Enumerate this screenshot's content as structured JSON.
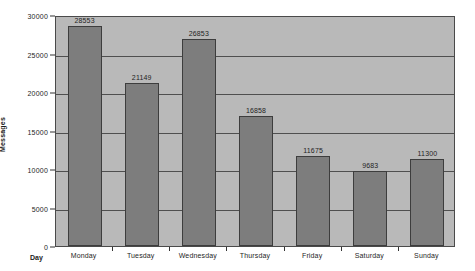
{
  "chart_data": {
    "type": "bar",
    "title": "",
    "subtitle": "",
    "xlabel": "Day",
    "ylabel": "Messages",
    "categories": [
      "Monday",
      "Tuesday",
      "Wednesday",
      "Thursday",
      "Friday",
      "Saturday",
      "Sunday"
    ],
    "values": [
      28553,
      21149,
      26853,
      16858,
      11675,
      9683,
      11300
    ],
    "value_labels": [
      "28553",
      "21149",
      "26853",
      "16858",
      "11675",
      "9683",
      "11300"
    ],
    "ylim": [
      0,
      30000
    ],
    "yticks": [
      0,
      5000,
      10000,
      15000,
      20000,
      25000,
      30000
    ],
    "ytick_labels": [
      "0",
      "5000",
      "10000",
      "15000",
      "20000",
      "25000",
      "30000"
    ],
    "grid": true,
    "grid_axis": "y",
    "legend": false,
    "legend_position": "none",
    "series": [
      {
        "name": "Messages",
        "values": [
          28553,
          21149,
          26853,
          16858,
          11675,
          9683,
          11300
        ]
      }
    ],
    "colors": {
      "bar_fill": "#7d7d7d",
      "bar_edge": "#3d3d3d",
      "plot_background": "#b9b9b9",
      "gridline": "#4f4f4f",
      "axis": "#333333",
      "text": "#1f1f1f",
      "figure_background": "#ffffff"
    }
  }
}
